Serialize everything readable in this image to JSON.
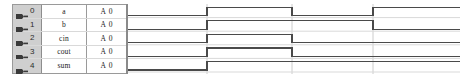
{
  "window": {
    "title": "Waveform Viewer",
    "background_color": "#ffffff"
  },
  "table": {
    "columns": [
      "index",
      "name",
      "radix",
      "value"
    ],
    "rows": [
      {
        "index": "0",
        "name": "a",
        "radix": "A",
        "value": "0",
        "icon": "plug-icon"
      },
      {
        "index": "1",
        "name": "b",
        "radix": "A",
        "value": "0",
        "icon": "plug-icon"
      },
      {
        "index": "2",
        "name": "cin",
        "radix": "A",
        "value": "0",
        "icon": "plug-icon"
      },
      {
        "index": "3",
        "name": "cout",
        "radix": "A",
        "value": "0",
        "icon": "plug-icon"
      },
      {
        "index": "4",
        "name": "sum",
        "radix": "A",
        "value": "0",
        "icon": "plug-icon"
      }
    ]
  },
  "waveform": {
    "time_start": 0,
    "time_end": 332,
    "row_height": 13.6,
    "signal_color": "#4a4a4a",
    "grid_color": "#d9d9d9",
    "cursor_color": "#cccccc",
    "cursors": [
      79,
      164,
      245
    ],
    "signals": [
      {
        "name": "a",
        "transitions": [
          {
            "t": 0,
            "level": 0
          },
          {
            "t": 79,
            "level": 1
          },
          {
            "t": 164,
            "level": 0
          },
          {
            "t": 245,
            "level": 1
          },
          {
            "t": 332,
            "level": 1
          }
        ]
      },
      {
        "name": "b",
        "transitions": [
          {
            "t": 0,
            "level": 0
          },
          {
            "t": 79,
            "level": 1
          },
          {
            "t": 164,
            "level": 1
          },
          {
            "t": 245,
            "level": 0
          },
          {
            "t": 332,
            "level": 0
          }
        ]
      },
      {
        "name": "cin",
        "transitions": [
          {
            "t": 0,
            "level": 0
          },
          {
            "t": 79,
            "level": 1
          },
          {
            "t": 164,
            "level": 0
          },
          {
            "t": 332,
            "level": 0
          }
        ]
      },
      {
        "name": "cout",
        "transitions": [
          {
            "t": 0,
            "level": 0
          },
          {
            "t": 79,
            "level": 1
          },
          {
            "t": 164,
            "level": 0
          },
          {
            "t": 332,
            "level": 0
          }
        ]
      },
      {
        "name": "sum",
        "transitions": [
          {
            "t": 0,
            "level": 0
          },
          {
            "t": 79,
            "level": 1
          },
          {
            "t": 332,
            "level": 1
          }
        ]
      }
    ]
  }
}
